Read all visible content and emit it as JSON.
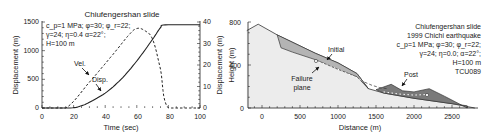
{
  "chart_data": [
    {
      "type": "line",
      "title": "Chiufengershan slide",
      "xlabel": "Time (sec)",
      "ylabel": "Displacement (m)",
      "ylabel_right": "Displacement (m)",
      "xlim": [
        0,
        100
      ],
      "ylim": [
        0,
        1500
      ],
      "ylim_right": [
        0,
        40
      ],
      "xticks": [
        0,
        20,
        40,
        60,
        80,
        100
      ],
      "yticks": [
        0,
        500,
        1000,
        1500
      ],
      "yticks_right": [
        0,
        10,
        20,
        30,
        40
      ],
      "annotation_lines": [
        "c_p=1 MPa; φ=30; φ_r=22;",
        "γ=24; η=0.4 α=22°;",
        "H=100 m"
      ],
      "series": [
        {
          "name": "Vel.",
          "style": "dashed",
          "axis": "right",
          "x": [
            0,
            15,
            30,
            45,
            55,
            60,
            65,
            70,
            75,
            80,
            100
          ],
          "values": [
            0,
            0,
            12,
            25,
            34,
            37,
            36,
            32,
            18,
            0,
            0
          ]
        },
        {
          "name": "Disp.",
          "style": "solid",
          "axis": "left",
          "x": [
            0,
            18,
            25,
            30,
            40,
            50,
            60,
            70,
            75,
            78,
            100
          ],
          "values": [
            0,
            0,
            40,
            100,
            260,
            500,
            820,
            1200,
            1400,
            1450,
            1450
          ]
        }
      ],
      "labels": [
        {
          "text": "Vel.",
          "x": 30,
          "y": 560
        },
        {
          "text": "Disp.",
          "x": 38,
          "y": 330
        }
      ]
    },
    {
      "type": "area",
      "title": "Chiufengershan slide",
      "subtitle": "1999 Chichi earthquake",
      "xlabel": "Distance (m)",
      "ylabel": "Height (m)",
      "xlim": [
        -200,
        2800
      ],
      "ylim": [
        0,
        800
      ],
      "xticks": [
        0,
        500,
        1000,
        1500,
        2000,
        2500
      ],
      "yticks": [
        0,
        400,
        800
      ],
      "annotation_lines": [
        "Chiufengershan slide",
        "1999 Chichi earthquake",
        "c_p=1 MPa; φ=30; φ_r=22;",
        "γ=24; η=0.0; α=22°;",
        "H=100 m",
        "TCU089"
      ],
      "series": [
        {
          "name": "Ground surface",
          "x": [
            -200,
            -50,
            200,
            700,
            1000,
            1250,
            1400,
            1600,
            2000,
            2500,
            2800
          ],
          "values": [
            720,
            780,
            680,
            510,
            420,
            320,
            180,
            140,
            90,
            40,
            0
          ]
        },
        {
          "name": "Initial",
          "x": [
            200,
            250,
            400,
            700,
            1000,
            1250,
            1400
          ],
          "values": [
            680,
            560,
            520,
            450,
            360,
            290,
            180
          ]
        },
        {
          "name": "Post",
          "x": [
            1500,
            1700,
            1850,
            2000,
            2200,
            2400,
            2700
          ],
          "values": [
            170,
            220,
            160,
            150,
            180,
            110,
            0
          ]
        }
      ],
      "labels": [
        {
          "text": "Initial"
        },
        {
          "text": "Failure"
        },
        {
          "text": "plane"
        },
        {
          "text": "Post"
        }
      ]
    }
  ],
  "left_chart": {
    "title": "Chiufengershan slide",
    "xlabel": "Time (sec)",
    "ylabel": "Displacement (m)",
    "ylabel_right": "Displacement (m)",
    "params": [
      "c_p=1 MPa; φ=30; φ_r=22;",
      "γ=24; η=0.4 α=22°;",
      "H=100 m"
    ],
    "vel_label": "Vel.",
    "disp_label": "Disp.",
    "xticks": [
      "0",
      "20",
      "40",
      "60",
      "80",
      "100"
    ],
    "yticks": [
      "0",
      "500",
      "1000",
      "1500"
    ],
    "yticks_right": [
      "0",
      "10",
      "20",
      "30",
      "40"
    ]
  },
  "right_chart": {
    "ylabel": "Height (m)",
    "xlabel": "Distance (m)",
    "legend": [
      "Chiufengershan slide",
      "1999 Chichi earthquake",
      "c_p=1 MPa; φ=30; φ_r=22;",
      "γ=24; η=0.0; α=22°;",
      "H=100 m",
      "TCU089"
    ],
    "initial_label": "Initial",
    "failure_label_1": "Failure",
    "failure_label_2": "plane",
    "post_label": "Post",
    "xticks": [
      "0",
      "500",
      "1000",
      "1500",
      "2000",
      "2500"
    ],
    "yticks": [
      "0",
      "400",
      "800"
    ]
  }
}
